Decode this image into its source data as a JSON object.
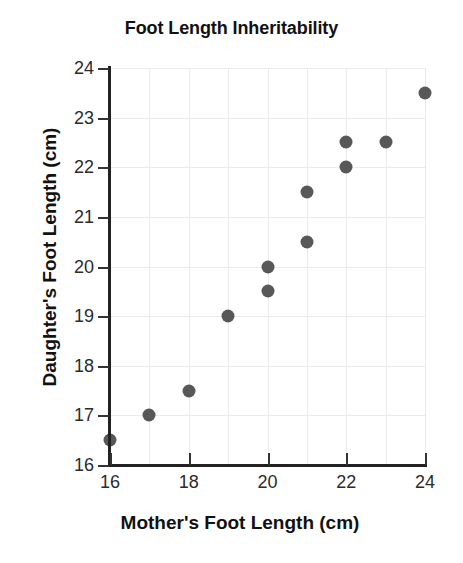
{
  "chart_data": {
    "type": "scatter",
    "title": "Foot Length Inheritability",
    "xlabel": "Mother's Foot Length (cm)",
    "ylabel": "Daughter's Foot Length (cm)",
    "xlim": [
      16,
      24
    ],
    "ylim": [
      16,
      24
    ],
    "grid": true,
    "legend": "none",
    "marker_color": "#585858",
    "gridline_color": "#ebebeb",
    "axis_color": "#222222",
    "background_color": "#ffffff",
    "xticks": [
      16,
      18,
      20,
      22,
      24
    ],
    "xtick_labels": [
      "16",
      "18",
      "20",
      "22",
      "24"
    ],
    "yticks": [
      16,
      17,
      18,
      19,
      20,
      21,
      22,
      23,
      24
    ],
    "ytick_labels": [
      "16",
      "17",
      "18",
      "19",
      "20",
      "21",
      "22",
      "23",
      "24"
    ],
    "x_gridlines": [
      16,
      17,
      18,
      19,
      20,
      21,
      22,
      23,
      24
    ],
    "y_gridlines": [
      16,
      17,
      18,
      19,
      20,
      21,
      22,
      23,
      24
    ],
    "series": [
      {
        "name": "mother-daughter-foot-length",
        "points": [
          {
            "x": 16,
            "y": 16.5
          },
          {
            "x": 17,
            "y": 17.0
          },
          {
            "x": 18,
            "y": 17.5
          },
          {
            "x": 19,
            "y": 19.0
          },
          {
            "x": 20,
            "y": 19.5
          },
          {
            "x": 20,
            "y": 20.0
          },
          {
            "x": 21,
            "y": 20.5
          },
          {
            "x": 21,
            "y": 21.5
          },
          {
            "x": 22,
            "y": 22.0
          },
          {
            "x": 22,
            "y": 22.5
          },
          {
            "x": 23,
            "y": 22.5
          },
          {
            "x": 24,
            "y": 23.5
          }
        ]
      }
    ]
  }
}
